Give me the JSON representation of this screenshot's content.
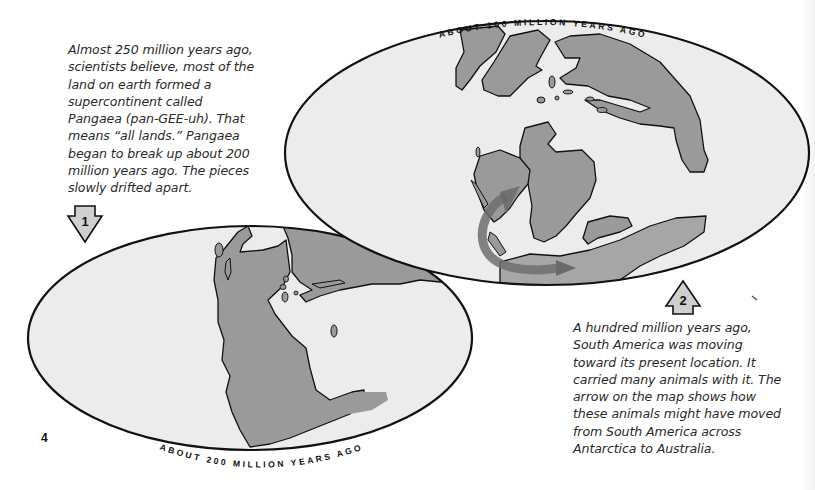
{
  "page": {
    "number": "4",
    "colors": {
      "ocean": "#ececec",
      "land": "#9a9a9a",
      "outline": "#111111",
      "migration_arrow": "#6f6f6f",
      "step_arrow_fill": "#cfcfcf"
    }
  },
  "intro_caption": {
    "text": "Almost 250 million years ago,\nscientists believe, most of the\nland on earth formed a\nsupercontinent called\nPangaea (pan-GEE-uh). That\nmeans “all lands.” Pangaea\nbegan to break up about 200\nmillion years ago. The pieces\nslowly drifted apart."
  },
  "steps": [
    {
      "number": "1",
      "direction": "down",
      "icon": "down-arrow-icon"
    },
    {
      "number": "2",
      "direction": "up",
      "icon": "up-arrow-icon"
    }
  ],
  "maps": {
    "earlier": {
      "label": "ABOUT 200 MILLION YEARS AGO",
      "description": "Pangaea supercontinent"
    },
    "later": {
      "label": "ABOUT 100 MILLION YEARS AGO",
      "description": "Continents drifting apart with migration arrow from South America across Antarctica to Australia"
    }
  },
  "explanation_caption": {
    "text": "A hundred million years ago,\nSouth America was moving\ntoward its present location. It\ncarried many animals with it. The\narrow on the map shows how\nthese animals might have moved\nfrom South America across\nAntarctica to Australia."
  }
}
